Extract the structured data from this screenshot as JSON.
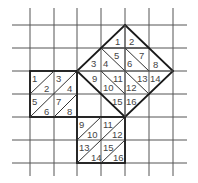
{
  "figure": {
    "colors": {
      "background": "#ffffff",
      "grid": "#555555",
      "outline": "#1a1a1a",
      "label": "#444444"
    }
  },
  "grid": {
    "x_lines": [
      30,
      54,
      77,
      101,
      125,
      149,
      173
    ],
    "y_lines": [
      25,
      48,
      71,
      94,
      117,
      140,
      163
    ],
    "x_extent": [
      12,
      187
    ],
    "y_extent": [
      8,
      176
    ]
  },
  "left_square": {
    "name": "leg-square-a",
    "labels": [
      "1",
      "2",
      "3",
      "4",
      "5",
      "6",
      "7",
      "8"
    ]
  },
  "bottom_square": {
    "name": "leg-square-b",
    "labels": [
      "9",
      "10",
      "11",
      "12",
      "13",
      "14",
      "15",
      "16"
    ]
  },
  "hypotenuse_square": {
    "name": "hypotenuse-square",
    "labels": [
      "1",
      "2",
      "3",
      "4",
      "5",
      "6",
      "7",
      "8",
      "9",
      "10",
      "11",
      "12",
      "13",
      "14",
      "15",
      "16"
    ]
  }
}
